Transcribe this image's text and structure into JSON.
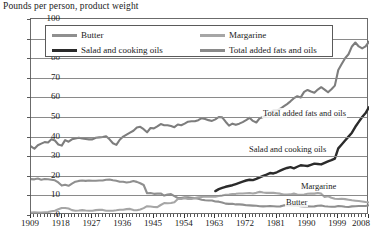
{
  "chart_data": {
    "type": "line",
    "title": "Pounds per person, product weight",
    "xlabel": "",
    "ylabel": "Pounds per person, product weight",
    "xlim": [
      1909,
      2008
    ],
    "ylim": [
      0,
      100
    ],
    "ytick_labels": [
      "100",
      "90",
      "80",
      "70",
      "60",
      "50",
      "40",
      "30",
      "20",
      "10",
      "0"
    ],
    "ytick_values": [
      100,
      90,
      80,
      70,
      60,
      50,
      40,
      30,
      20,
      10,
      0
    ],
    "xtick_labels": [
      "1909",
      "1918",
      "1927",
      "1936",
      "1945",
      "1954",
      "1963",
      "1972",
      "1981",
      "1990",
      "1999",
      "2008"
    ],
    "xtick_values": [
      1909,
      1918,
      1927,
      1936,
      1945,
      1954,
      1963,
      1972,
      1981,
      1990,
      1999,
      2008
    ],
    "grid": true,
    "legend_position": "top-inside",
    "series": [
      {
        "name": "Butter",
        "color": "#8f8f8f",
        "label_in_chart": "Butter",
        "x": [
          1909,
          1910,
          1911,
          1912,
          1913,
          1914,
          1915,
          1916,
          1917,
          1918,
          1919,
          1920,
          1921,
          1922,
          1923,
          1924,
          1925,
          1926,
          1927,
          1928,
          1929,
          1930,
          1931,
          1932,
          1933,
          1934,
          1935,
          1936,
          1937,
          1938,
          1939,
          1940,
          1941,
          1942,
          1943,
          1944,
          1945,
          1946,
          1947,
          1948,
          1949,
          1950,
          1951,
          1952,
          1953,
          1954,
          1955,
          1956,
          1957,
          1958,
          1959,
          1960,
          1961,
          1962,
          1963,
          1964,
          1965,
          1966,
          1967,
          1968,
          1969,
          1970,
          1971,
          1972,
          1973,
          1974,
          1975,
          1976,
          1977,
          1978,
          1979,
          1980,
          1981,
          1982,
          1983,
          1984,
          1985,
          1986,
          1987,
          1988,
          1989,
          1990,
          1991,
          1992,
          1993,
          1994,
          1995,
          1996,
          1997,
          1998,
          1999,
          2000,
          2001,
          2002,
          2003,
          2004,
          2005,
          2006,
          2007,
          2008
        ],
        "values": [
          18.3,
          18.2,
          18.6,
          18.0,
          18.4,
          18.2,
          18.0,
          17.7,
          16.6,
          15.0,
          15.4,
          14.9,
          16.0,
          17.0,
          17.4,
          17.6,
          17.4,
          17.6,
          17.5,
          17.5,
          17.6,
          17.6,
          18.0,
          18.1,
          17.7,
          17.5,
          17.0,
          17.0,
          16.6,
          16.8,
          17.3,
          16.9,
          16.2,
          15.3,
          11.1,
          11.2,
          10.8,
          10.9,
          11.0,
          9.9,
          10.4,
          10.7,
          9.6,
          8.7,
          8.6,
          9.0,
          9.0,
          8.8,
          8.6,
          8.3,
          7.8,
          7.5,
          7.4,
          7.4,
          6.9,
          6.8,
          6.4,
          5.8,
          5.7,
          5.7,
          5.4,
          5.4,
          5.3,
          5.0,
          4.9,
          4.8,
          4.7,
          4.5,
          4.4,
          4.5,
          4.6,
          4.5,
          4.3,
          4.4,
          4.9,
          5.0,
          4.9,
          4.7,
          4.7,
          4.5,
          4.3,
          4.4,
          4.3,
          4.4,
          4.7,
          4.8,
          4.5,
          4.3,
          4.2,
          4.2,
          4.6,
          4.5,
          4.2,
          4.1,
          4.4,
          4.5,
          4.6,
          4.6,
          4.6,
          5.0
        ]
      },
      {
        "name": "Margarine",
        "color": "#a6a6a6",
        "label_in_chart": "Margarine",
        "x": [
          1909,
          1910,
          1911,
          1912,
          1913,
          1914,
          1915,
          1916,
          1917,
          1918,
          1919,
          1920,
          1921,
          1922,
          1923,
          1924,
          1925,
          1926,
          1927,
          1928,
          1929,
          1930,
          1931,
          1932,
          1933,
          1934,
          1935,
          1936,
          1937,
          1938,
          1939,
          1940,
          1941,
          1942,
          1943,
          1944,
          1945,
          1946,
          1947,
          1948,
          1949,
          1950,
          1951,
          1952,
          1953,
          1954,
          1955,
          1956,
          1957,
          1958,
          1959,
          1960,
          1961,
          1962,
          1963,
          1964,
          1965,
          1966,
          1967,
          1968,
          1969,
          1970,
          1971,
          1972,
          1973,
          1974,
          1975,
          1976,
          1977,
          1978,
          1979,
          1980,
          1981,
          1982,
          1983,
          1984,
          1985,
          1986,
          1987,
          1988,
          1989,
          1990,
          1991,
          1992,
          1993,
          1994,
          1995,
          1996,
          1997,
          1998,
          1999,
          2000,
          2001,
          2002,
          2003,
          2004,
          2005,
          2006,
          2007,
          2008
        ],
        "values": [
          1.3,
          1.4,
          1.3,
          1.3,
          1.4,
          1.5,
          1.9,
          2.2,
          2.9,
          3.6,
          3.6,
          3.3,
          2.5,
          2.2,
          2.3,
          2.5,
          2.3,
          2.2,
          2.2,
          2.5,
          2.6,
          2.6,
          2.2,
          2.2,
          2.2,
          2.4,
          2.7,
          2.7,
          3.0,
          3.1,
          2.5,
          2.4,
          2.8,
          3.5,
          4.5,
          4.3,
          4.1,
          4.0,
          5.1,
          6.1,
          6.0,
          6.1,
          6.5,
          8.2,
          8.2,
          8.6,
          8.2,
          8.2,
          8.6,
          9.0,
          9.2,
          9.4,
          9.4,
          9.3,
          9.3,
          9.7,
          9.9,
          10.3,
          10.4,
          10.7,
          10.8,
          11.0,
          11.0,
          11.1,
          11.2,
          11.0,
          11.3,
          11.8,
          11.5,
          11.3,
          11.3,
          11.3,
          11.1,
          10.9,
          10.4,
          10.4,
          10.5,
          10.9,
          10.5,
          10.3,
          10.5,
          10.8,
          11.0,
          10.9,
          11.2,
          10.9,
          9.2,
          9.6,
          8.8,
          8.3,
          8.2,
          8.3,
          8.1,
          7.8,
          7.5,
          7.3,
          7.1,
          6.9,
          6.6,
          6.4
        ]
      },
      {
        "name": "Salad and cooking oils",
        "color": "#2b2b2b",
        "label_in_chart": "Salad and cooking oils",
        "x": [
          1963,
          1964,
          1965,
          1966,
          1967,
          1968,
          1969,
          1970,
          1971,
          1972,
          1973,
          1974,
          1975,
          1976,
          1977,
          1978,
          1979,
          1980,
          1981,
          1982,
          1983,
          1984,
          1985,
          1986,
          1987,
          1988,
          1989,
          1990,
          1991,
          1992,
          1993,
          1994,
          1995,
          1996,
          1997,
          1998,
          1999,
          2000,
          2001,
          2002,
          2003,
          2004,
          2005,
          2006,
          2007,
          2008
        ],
        "values": [
          12.2,
          13.2,
          13.8,
          14.4,
          14.8,
          15.2,
          15.8,
          16.4,
          17.0,
          17.6,
          18.0,
          17.8,
          18.4,
          19.2,
          20.0,
          20.6,
          21.4,
          21.2,
          21.8,
          22.6,
          23.4,
          24.0,
          24.4,
          23.8,
          24.6,
          25.4,
          25.2,
          25.0,
          25.6,
          26.2,
          26.0,
          25.8,
          26.6,
          27.4,
          28.0,
          28.8,
          34.0,
          36.0,
          38.0,
          40.0,
          42.0,
          45.0,
          47.5,
          50.0,
          52.0,
          55.0
        ]
      },
      {
        "name": "Total added fats and oils",
        "color": "#7d7d7d",
        "label_in_chart": "Total added fats and oils",
        "x": [
          1909,
          1910,
          1911,
          1912,
          1913,
          1914,
          1915,
          1916,
          1917,
          1918,
          1919,
          1920,
          1921,
          1922,
          1923,
          1924,
          1925,
          1926,
          1927,
          1928,
          1929,
          1930,
          1931,
          1932,
          1933,
          1934,
          1935,
          1936,
          1937,
          1938,
          1939,
          1940,
          1941,
          1942,
          1943,
          1944,
          1945,
          1946,
          1947,
          1948,
          1949,
          1950,
          1951,
          1952,
          1953,
          1954,
          1955,
          1956,
          1957,
          1958,
          1959,
          1960,
          1961,
          1962,
          1963,
          1964,
          1965,
          1966,
          1967,
          1968,
          1969,
          1970,
          1971,
          1972,
          1973,
          1974,
          1975,
          1976,
          1977,
          1978,
          1979,
          1980,
          1981,
          1982,
          1983,
          1984,
          1985,
          1986,
          1987,
          1988,
          1989,
          1990,
          1991,
          1992,
          1993,
          1994,
          1995,
          1996,
          1997,
          1998,
          1999,
          2000,
          2001,
          2002,
          2003,
          2004,
          2005,
          2006,
          2007,
          2008
        ],
        "values": [
          35.0,
          33.8,
          35.6,
          36.4,
          37.2,
          37.0,
          38.6,
          38.0,
          36.0,
          35.4,
          38.2,
          37.4,
          38.6,
          39.0,
          39.4,
          39.0,
          38.8,
          38.6,
          38.6,
          39.4,
          39.6,
          39.8,
          40.2,
          38.6,
          36.6,
          35.8,
          38.4,
          40.0,
          41.0,
          42.0,
          43.0,
          44.6,
          45.0,
          43.8,
          42.2,
          44.4,
          44.2,
          45.2,
          46.4,
          45.8,
          45.8,
          45.4,
          44.8,
          46.2,
          45.8,
          46.6,
          47.6,
          47.8,
          47.8,
          48.4,
          49.4,
          49.0,
          48.4,
          48.0,
          48.8,
          50.0,
          49.8,
          47.6,
          45.6,
          46.6,
          46.0,
          46.6,
          47.4,
          48.4,
          49.6,
          48.0,
          47.2,
          49.4,
          50.0,
          51.0,
          52.4,
          53.4,
          53.4,
          54.2,
          55.4,
          56.6,
          58.0,
          59.6,
          60.6,
          60.0,
          62.8,
          63.8,
          63.0,
          62.4,
          64.0,
          65.2,
          64.0,
          62.6,
          64.2,
          66.0,
          74.0,
          77.0,
          80.0,
          82.0,
          86.0,
          88.0,
          86.0,
          85.0,
          86.0,
          88.5
        ]
      }
    ]
  },
  "legend": {
    "entries": [
      {
        "label": "Butter",
        "color": "#8f8f8f"
      },
      {
        "label": "Margarine",
        "color": "#a6a6a6"
      },
      {
        "label": "Salad and cooking oils",
        "color": "#2b2b2b"
      },
      {
        "label": "Total added fats and oils",
        "color": "#8a8a8a"
      }
    ]
  },
  "inline_labels": [
    {
      "text": "Total added fats and oils",
      "left": 262,
      "top": 108
    },
    {
      "text": "Salad and cooking oils",
      "left": 248,
      "top": 144
    },
    {
      "text": "Margarine",
      "left": 300,
      "top": 181
    },
    {
      "text": "Butter",
      "left": 285,
      "top": 197
    }
  ]
}
